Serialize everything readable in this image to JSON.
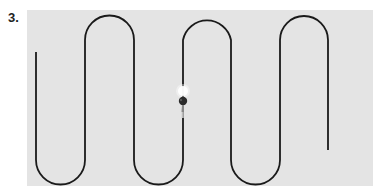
{
  "figure": {
    "label": "3.",
    "panel_color": "#e4e4e4",
    "path_color": "#1a1a1a",
    "path": {
      "start": [
        36,
        52
      ],
      "columns_x": [
        36,
        85,
        134,
        183,
        231,
        280,
        328
      ],
      "top_y": 40,
      "bottom_y": 160,
      "end": [
        328,
        150
      ]
    },
    "object": {
      "icon": "walker-with-light-icon",
      "x": 183,
      "y": 100
    }
  }
}
